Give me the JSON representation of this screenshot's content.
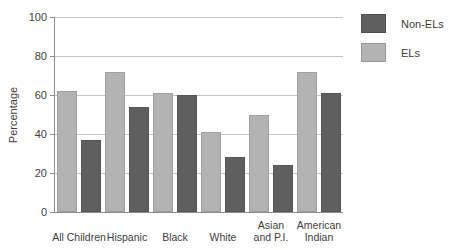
{
  "chart_data": {
    "type": "bar",
    "title": "",
    "xlabel": "",
    "ylabel": "Percentage",
    "ylim": [
      0,
      100
    ],
    "yticks": [
      0,
      20,
      40,
      60,
      80,
      100
    ],
    "grid": true,
    "legend_position": "right",
    "categories": [
      "All Children",
      "Hispanic",
      "Black",
      "White",
      "Asian\nand P.I.",
      "American\nIndian"
    ],
    "series": [
      {
        "name": "ELs",
        "color": "#b3b3b3",
        "values": [
          62,
          72,
          61,
          41,
          50,
          72
        ]
      },
      {
        "name": "Non-ELs",
        "color": "#5f5f5f",
        "values": [
          37,
          54,
          60,
          28,
          24,
          61
        ]
      }
    ],
    "legend": [
      {
        "label": "Non-ELs",
        "color": "#5f5f5f"
      },
      {
        "label": "ELs",
        "color": "#b3b3b3"
      }
    ]
  },
  "colors": {
    "background": "#ffffff",
    "gridline": "#c6c6c6",
    "axis": "#8f8f8f",
    "text": "#3d3d3d"
  }
}
